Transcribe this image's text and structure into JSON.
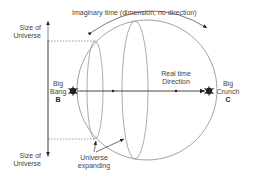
{
  "diagram": {
    "type": "cosmology-time-diagram",
    "labels": {
      "imaginary_time": "Imaginary time (dimension, no direction)",
      "size_top_line1": "Size of",
      "size_top_line2": "Universe",
      "size_bottom_line1": "Size of",
      "size_bottom_line2": "Universe",
      "big_bang_line1": "Big",
      "big_bang_line2": "Bang",
      "big_bang_letter": "B",
      "big_crunch_line1": "Big",
      "big_crunch_line2": "Crunch",
      "big_crunch_letter": "C",
      "real_time_line1": "Real time",
      "real_time_line2": "Direction",
      "expanding_line1": "Universe",
      "expanding_line2": "expanding"
    },
    "colors": {
      "line": "#8a8a8a",
      "dark": "#222222",
      "text": "#444444"
    }
  }
}
